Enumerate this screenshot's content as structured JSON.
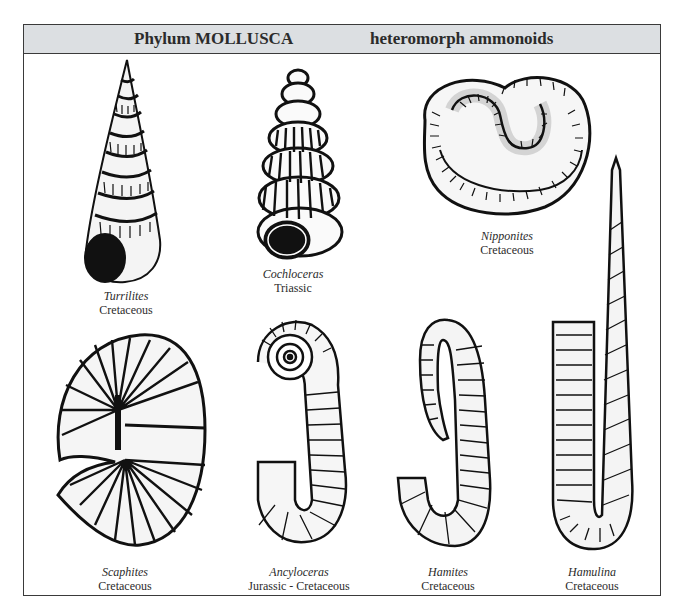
{
  "header": {
    "phylum": "Phylum MOLLUSCA",
    "group": "heteromorph ammonoids",
    "background_color": "#dcdfe2",
    "border_color": "#3a3a3a"
  },
  "specimens": [
    {
      "genus": "Turrilites",
      "period": "Cretaceous",
      "illustration": "high-spired-helical-shell"
    },
    {
      "genus": "Cochloceras",
      "period": "Triassic",
      "illustration": "ribbed-helical-shell"
    },
    {
      "genus": "Nipponites",
      "period": "Cretaceous",
      "illustration": "knotted-coiled-shell"
    },
    {
      "genus": "Scaphites",
      "period": "Cretaceous",
      "illustration": "hooked-planispiral-shell"
    },
    {
      "genus": "Ancyloceras",
      "period": "Jurassic - Cretaceous",
      "illustration": "open-coil-hook-shell"
    },
    {
      "genus": "Hamites",
      "period": "Cretaceous",
      "illustration": "multi-hooked-shell"
    },
    {
      "genus": "Hamulina",
      "period": "Cretaceous",
      "illustration": "single-hook-paperclip-shell"
    }
  ]
}
